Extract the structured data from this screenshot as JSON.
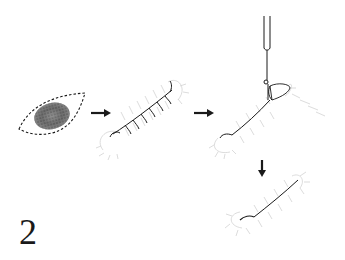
{
  "figure": {
    "number": "2"
  },
  "steps": [
    {
      "id": "excision",
      "label": "Elliptical excision around pigmented lesion"
    },
    {
      "id": "sutured",
      "label": "Incision closed with interrupted sutures"
    },
    {
      "id": "removal",
      "label": "Suture removal with forceps"
    },
    {
      "id": "healed",
      "label": "Healed linear scar"
    }
  ],
  "arrows": [
    {
      "id": "arrow-1",
      "direction": "right"
    },
    {
      "id": "arrow-2",
      "direction": "right"
    },
    {
      "id": "arrow-3",
      "direction": "down"
    }
  ],
  "colors": {
    "ink": "#1a1a1a",
    "stipple": "#c8c8c8",
    "background": "#ffffff"
  }
}
